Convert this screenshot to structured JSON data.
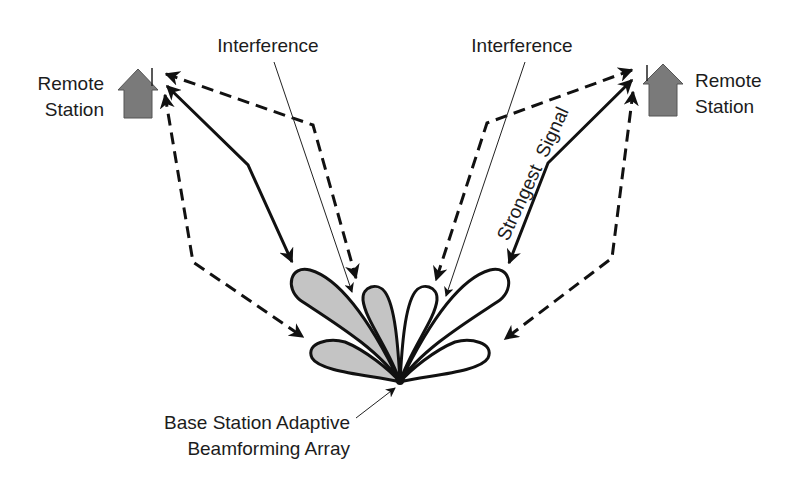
{
  "diagram": {
    "labels": {
      "interference_left": "Interference",
      "interference_right": "Interference",
      "remote_left_line1": "Remote",
      "remote_left_line2": "Station",
      "remote_right_line1": "Remote",
      "remote_right_line2": "Station",
      "strongest_signal": "Strongest  Signal",
      "base_station_line1": "Base Station Adaptive",
      "base_station_line2": "Beamforming Array"
    },
    "colors": {
      "line": "#111111",
      "house_fill": "#7a7a7a",
      "lobe_shaded": "#c4c4c4",
      "lobe_clear": "#ffffff",
      "background": "#ffffff"
    },
    "nodes": [
      {
        "id": "remote-station-left",
        "type": "house-icon"
      },
      {
        "id": "remote-station-right",
        "type": "house-icon"
      },
      {
        "id": "base-station-array",
        "type": "antenna-array"
      }
    ],
    "lobes": [
      {
        "id": "lobe-1",
        "side": "left",
        "shaded": true
      },
      {
        "id": "lobe-2",
        "side": "left",
        "shaded": true
      },
      {
        "id": "lobe-3",
        "side": "left",
        "shaded": true
      },
      {
        "id": "lobe-4",
        "side": "right",
        "shaded": false
      },
      {
        "id": "lobe-5",
        "side": "right",
        "shaded": false
      },
      {
        "id": "lobe-6",
        "side": "right",
        "shaded": false
      }
    ],
    "paths": [
      {
        "id": "left-direct",
        "style": "solid"
      },
      {
        "id": "left-multipath-upper",
        "style": "dashed"
      },
      {
        "id": "left-multipath-lower",
        "style": "dashed"
      },
      {
        "id": "right-direct-strongest",
        "style": "solid"
      },
      {
        "id": "right-multipath-upper",
        "style": "dashed"
      },
      {
        "id": "right-multipath-lower",
        "style": "dashed"
      },
      {
        "id": "interference-left",
        "style": "thin"
      },
      {
        "id": "interference-right",
        "style": "thin"
      }
    ]
  }
}
